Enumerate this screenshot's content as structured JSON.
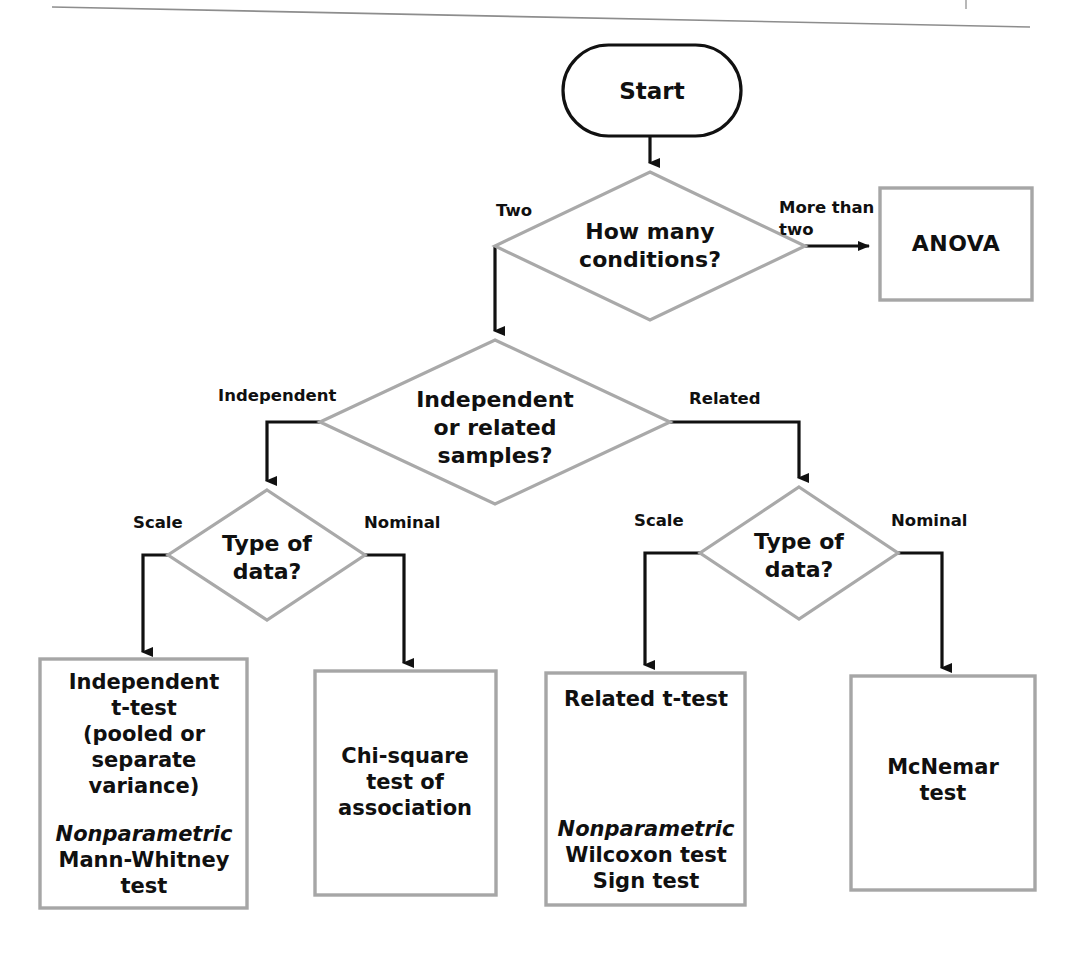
{
  "diagram": {
    "colors": {
      "terminator_border": "#111111",
      "decision_border": "#a9a9a9",
      "process_border": "#a6a6a6",
      "connector": "#111111",
      "text": "#101010",
      "background": "#ffffff"
    },
    "nodes": {
      "start": {
        "shape": "stadium",
        "label": "Start"
      },
      "conditions": {
        "shape": "diamond",
        "line1": "How many",
        "line2": "conditions?"
      },
      "anova": {
        "shape": "rectangle",
        "label": "ANOVA"
      },
      "samples": {
        "shape": "diamond",
        "line1": "Independent",
        "line2": "or related",
        "line3": "samples?"
      },
      "type_of_data_left": {
        "shape": "diamond",
        "line1": "Type of",
        "line2": "data?"
      },
      "type_of_data_right": {
        "shape": "diamond",
        "line1": "Type of",
        "line2": "data?"
      },
      "independent_t_test": {
        "shape": "rectangle",
        "lines": [
          "Independent",
          "t-test",
          "(pooled or",
          "separate",
          "variance)"
        ],
        "nonparametric_heading": "Nonparametric",
        "nonparametric_lines": [
          "Mann-Whitney",
          "test"
        ]
      },
      "chi_square": {
        "shape": "rectangle",
        "lines": [
          "Chi-square",
          "test of",
          "association"
        ]
      },
      "related_t_test": {
        "shape": "rectangle",
        "lines": [
          "Related t-test"
        ],
        "nonparametric_heading": "Nonparametric",
        "nonparametric_lines": [
          "Wilcoxon test",
          "Sign test"
        ]
      },
      "mcnemar": {
        "shape": "rectangle",
        "lines": [
          "McNemar",
          "test"
        ]
      }
    },
    "edge_labels": {
      "two": "Two",
      "more_than_two_line1": "More than",
      "more_than_two_line2": "two",
      "independent": "Independent",
      "related": "Related",
      "scale_left": "Scale",
      "nominal_left": "Nominal",
      "scale_right": "Scale",
      "nominal_right": "Nominal"
    }
  }
}
